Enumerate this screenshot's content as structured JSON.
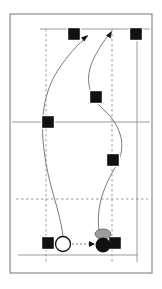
{
  "figure": {
    "width": 162,
    "height": 289,
    "background_color": "#ffffff"
  },
  "frame": {
    "label": "diagram-border",
    "x": 10,
    "y": 14,
    "width": 142,
    "height": 259,
    "stroke_color": "#8c8c8c",
    "stroke_width": 1.2,
    "fill_color": "#ffffff"
  },
  "court_lines": {
    "solid_color": "#9a9a9a",
    "dashed_color": "#8f8f8f",
    "solid_horizontal": [
      {
        "name": "top-boundary-line",
        "y": 29,
        "x1": 40,
        "x2": 150
      },
      {
        "name": "mid-boundary-line",
        "y": 122,
        "x1": 12,
        "x2": 150
      },
      {
        "name": "bottom-boundary-line",
        "y": 255,
        "x1": 18,
        "x2": 138
      }
    ],
    "solid_vertical": [
      {
        "name": "right-sideline",
        "x": 137,
        "y1": 29,
        "y2": 262
      }
    ],
    "dashed_vertical": [
      {
        "name": "left-attack-line",
        "x": 46,
        "y1": 29,
        "y2": 262
      },
      {
        "name": "right-attack-line",
        "x": 112,
        "y1": 29,
        "y2": 262
      }
    ],
    "dashed_horizontal": [
      {
        "name": "three-meter-line",
        "y": 199,
        "x1": 16,
        "x2": 148
      }
    ]
  },
  "markers": {
    "color": "#111111",
    "squares": [
      {
        "id": "square-top-center",
        "label": "player-position-1",
        "cx": 74,
        "cy": 34,
        "size": 13
      },
      {
        "id": "square-top-right",
        "label": "player-position-2",
        "cx": 136,
        "cy": 34,
        "size": 13
      },
      {
        "id": "square-mid-center",
        "label": "player-position-3",
        "cx": 96,
        "cy": 97,
        "size": 13
      },
      {
        "id": "square-mid-left",
        "label": "player-position-4",
        "cx": 48,
        "cy": 122,
        "size": 13
      },
      {
        "id": "square-mid-right",
        "label": "player-position-5",
        "cx": 113,
        "cy": 160,
        "size": 13
      },
      {
        "id": "square-bottom-left",
        "label": "player-position-6",
        "cx": 48,
        "cy": 243,
        "size": 13
      },
      {
        "id": "square-bottom-right",
        "label": "player-position-7",
        "cx": 115,
        "cy": 243,
        "size": 13
      }
    ],
    "open_circle": {
      "id": "start-marker-open",
      "label": "origin-token",
      "cx": 63,
      "cy": 244,
      "r": 7.5,
      "fill_color": "#ffffff",
      "stroke_color": "#111111"
    },
    "filled_circle": {
      "id": "end-marker-filled",
      "label": "target-token",
      "cx": 103,
      "cy": 245,
      "r": 7.5,
      "fill_color": "#111111"
    },
    "gray_ellipse": {
      "id": "ball-marker-gray",
      "label": "ball-token",
      "cx": 103,
      "cy": 234,
      "rx": 8,
      "ry": 5,
      "fill_color": "#9d9d9d",
      "stroke_color": "#5e5e5e"
    }
  },
  "paths": {
    "stroke_color": "#6b6b6b",
    "stroke_width": 0.9,
    "curves": [
      {
        "id": "path-left-loop",
        "label": "movement-path-left",
        "d": "M 63 236 C 60 210, 48 185, 44 150 C 40 118, 44 92, 58 70 C 68 55, 78 44, 88 36",
        "arrow": {
          "tip_x": 88,
          "tip_y": 35,
          "angle_deg": -40
        }
      },
      {
        "id": "path-right-s",
        "label": "movement-path-right",
        "d": "M 99 231 C 96 206, 104 186, 116 166 C 127 148, 122 126, 104 110 C 88 96, 84 78, 94 58 C 100 46, 106 38, 111 32",
        "arrow": {
          "tip_x": 112,
          "tip_y": 31,
          "angle_deg": -58
        }
      }
    ],
    "dashed_arrow": {
      "id": "pass-arrow",
      "label": "pass-direction-arrow",
      "x1": 72,
      "y1": 244,
      "x2": 93,
      "y2": 244,
      "stroke_color": "#6b6b6b",
      "arrowhead_color": "#111111"
    }
  }
}
